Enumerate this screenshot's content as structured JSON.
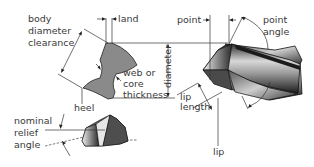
{
  "diagram": {
    "labels": {
      "body_diameter_clearance": [
        "body",
        "diameter",
        "clearance"
      ],
      "land": "land",
      "point": "point",
      "point_angle": [
        "point",
        "angle"
      ],
      "web": [
        "web or",
        "core",
        "thickness"
      ],
      "diameter": "diameter",
      "heel": "heel",
      "lip": "lip",
      "lip_length": [
        "lip",
        "length"
      ],
      "nominal_relief_angle": [
        "nominal",
        "relief",
        "angle"
      ]
    },
    "colors": {
      "cross_section_fill": "#8a8a8a",
      "line": "#333333",
      "text": "#3a3a3a",
      "background": "#ffffff"
    }
  }
}
